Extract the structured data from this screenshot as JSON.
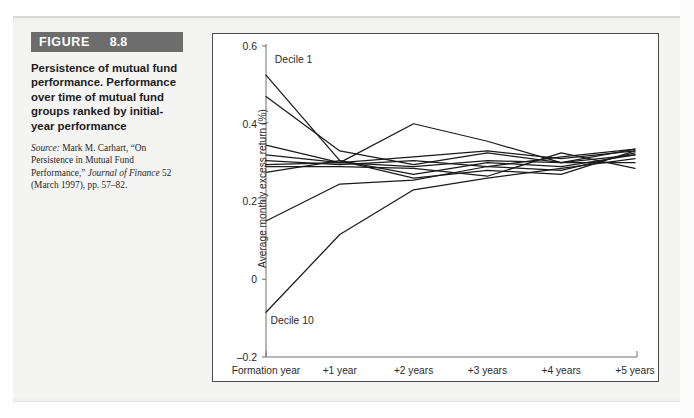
{
  "figure": {
    "banner_word": "FIGURE",
    "banner_number": "8.8",
    "title": "Persistence of mutual fund performance. Performance over time of mutual fund groups ranked by initial-year performance",
    "source_prefix": "Source:",
    "source_text_1": " Mark M. Carhart, “On Persistence in Mutual Fund Performance,” ",
    "source_italic": "Journal of Finance",
    "source_text_2": " 52 (March 1997), pp. 57–82."
  },
  "colors": {
    "banner_bg": "#6d6d6d",
    "banner_text": "#ffffff",
    "line": "#1a1a1a",
    "axis": "#6f6f6f",
    "box_border": "#4a4a4a",
    "page_bg": "#f4f4f2"
  },
  "chart_data": {
    "type": "line",
    "title": "",
    "xlabel": "",
    "ylabel": "Average monthly excess return (%)",
    "grid": false,
    "legend": "inline-annotations",
    "categories": [
      "Formation year",
      "+1 year",
      "+2 years",
      "+3 years",
      "+4 years",
      "+5 years"
    ],
    "x": [
      0,
      1,
      2,
      3,
      4,
      5
    ],
    "ylim": [
      -0.2,
      0.6
    ],
    "yticks": [
      0.6,
      0.4,
      0.2,
      0,
      -0.2
    ],
    "ytick_labels": [
      "0.6",
      "0.4",
      "0.2",
      "0",
      "–0.2"
    ],
    "annotations": [
      {
        "text": "Decile 1",
        "x": 0.12,
        "y": 0.555
      },
      {
        "text": "Decile 10",
        "x": 0.06,
        "y": -0.115
      }
    ],
    "series": [
      {
        "name": "Decile 1",
        "values": [
          0.525,
          0.305,
          0.27,
          0.3,
          0.29,
          0.32
        ]
      },
      {
        "name": "Decile 2",
        "values": [
          0.47,
          0.33,
          0.295,
          0.325,
          0.3,
          0.335
        ]
      },
      {
        "name": "Decile 3",
        "values": [
          0.345,
          0.3,
          0.4,
          0.355,
          0.3,
          0.32
        ]
      },
      {
        "name": "Decile 4",
        "values": [
          0.32,
          0.3,
          0.315,
          0.33,
          0.31,
          0.33
        ]
      },
      {
        "name": "Decile 5",
        "values": [
          0.305,
          0.295,
          0.305,
          0.29,
          0.315,
          0.335
        ]
      },
      {
        "name": "Decile 6",
        "values": [
          0.295,
          0.3,
          0.29,
          0.305,
          0.3,
          0.3
        ]
      },
      {
        "name": "Decile 7",
        "values": [
          0.29,
          0.29,
          0.285,
          0.265,
          0.325,
          0.285
        ]
      },
      {
        "name": "Decile 8",
        "values": [
          0.275,
          0.305,
          0.26,
          0.28,
          0.27,
          0.33
        ]
      },
      {
        "name": "Decile 9",
        "values": [
          0.15,
          0.245,
          0.255,
          0.29,
          0.28,
          0.325
        ]
      },
      {
        "name": "Decile 10",
        "values": [
          -0.085,
          0.115,
          0.23,
          0.26,
          0.285,
          0.31
        ]
      }
    ]
  }
}
